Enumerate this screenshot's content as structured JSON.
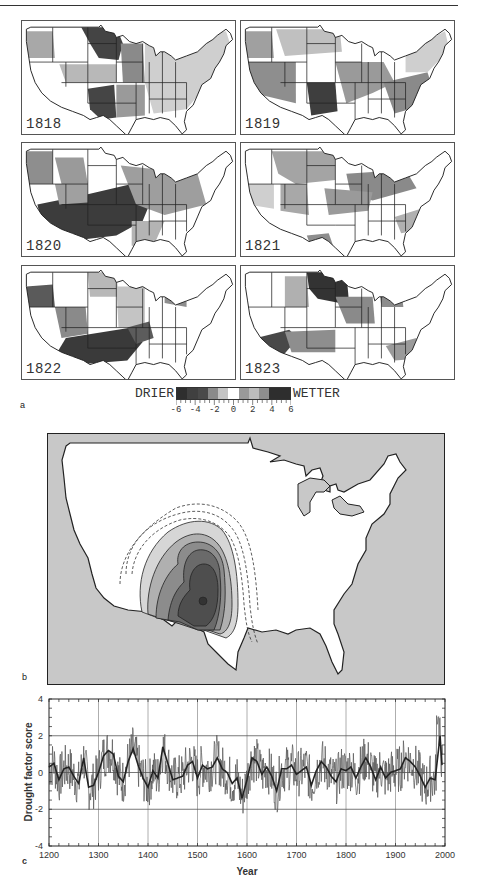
{
  "figure": {
    "panel_a": {
      "letter": "a",
      "maps": [
        {
          "year": "1818"
        },
        {
          "year": "1819"
        },
        {
          "year": "1820"
        },
        {
          "year": "1821"
        },
        {
          "year": "1822"
        },
        {
          "year": "1823"
        }
      ],
      "legend": {
        "left_label": "DRIER",
        "right_label": "WETTER",
        "ticks": [
          "-6",
          "-4",
          "-2",
          "0",
          "2",
          "4",
          "6"
        ],
        "colors": [
          "#2e2e2e",
          "#404040",
          "#4a4a4a",
          "#8a8a8a",
          "#c4c4c4",
          "#ffffff",
          "#9a9a9a",
          "#bcbcbc",
          "#8e8e8e",
          "#2e2e2e",
          "#2e2e2e"
        ]
      }
    },
    "panel_b": {
      "letter": "b",
      "ocean_color": "#c8c8c8",
      "land_color": "#ffffff"
    },
    "panel_c": {
      "letter": "c"
    }
  },
  "chart_data": {
    "type": "line",
    "title": "",
    "xlabel": "Year",
    "ylabel": "Drought factor score",
    "xlim": [
      1200,
      2000
    ],
    "ylim": [
      -4,
      4
    ],
    "xticks": [
      1200,
      1300,
      1400,
      1500,
      1600,
      1700,
      1800,
      1900,
      2000
    ],
    "yticks": [
      -4,
      -2,
      0,
      2,
      4
    ],
    "grid": {
      "vertical": [
        1300,
        1400,
        1500,
        1600,
        1700,
        1800,
        1900
      ],
      "horizontal": [
        -2,
        0,
        2
      ]
    },
    "series": [
      {
        "name": "smoothed",
        "x": [
          1200,
          1210,
          1220,
          1230,
          1240,
          1250,
          1260,
          1270,
          1280,
          1290,
          1300,
          1310,
          1320,
          1330,
          1340,
          1350,
          1360,
          1370,
          1380,
          1390,
          1400,
          1410,
          1420,
          1430,
          1440,
          1450,
          1460,
          1470,
          1480,
          1490,
          1500,
          1510,
          1520,
          1530,
          1540,
          1550,
          1560,
          1570,
          1580,
          1590,
          1600,
          1610,
          1620,
          1630,
          1640,
          1650,
          1660,
          1670,
          1680,
          1690,
          1700,
          1710,
          1720,
          1730,
          1740,
          1750,
          1760,
          1770,
          1780,
          1790,
          1800,
          1810,
          1820,
          1830,
          1840,
          1850,
          1860,
          1870,
          1880,
          1890,
          1900,
          1910,
          1920,
          1930,
          1940,
          1950,
          1960,
          1970,
          1980,
          1990,
          1995
        ],
        "values": [
          0.3,
          0.5,
          -0.4,
          0.2,
          0.3,
          -0.2,
          -0.6,
          0.8,
          -0.8,
          -0.7,
          0.0,
          0.9,
          1.2,
          1.0,
          -0.2,
          -0.5,
          0.6,
          1.3,
          0.4,
          -0.3,
          -0.8,
          0.1,
          -0.3,
          1.4,
          0.5,
          -0.4,
          -0.3,
          -0.2,
          0.4,
          0.6,
          -0.3,
          0.4,
          0.2,
          0.3,
          0.8,
          0.2,
          0.0,
          -0.6,
          -0.3,
          -1.4,
          -0.4,
          0.8,
          0.6,
          -0.1,
          0.3,
          -0.2,
          -1.0,
          0.2,
          0.2,
          0.4,
          -0.1,
          0.1,
          0.3,
          -0.7,
          0.1,
          0.6,
          0.3,
          -0.2,
          -0.5,
          0.2,
          0.1,
          0.3,
          -0.3,
          0.3,
          0.8,
          0.3,
          -0.4,
          0.3,
          -0.3,
          0.0,
          0.1,
          0.2,
          0.8,
          0.6,
          0.3,
          -0.2,
          -0.8,
          -0.3,
          -0.4,
          2.0,
          0.0
        ]
      },
      {
        "name": "annual",
        "note": "high-frequency annual series; range approx -2.5 to 3.2, peak ~3.2 near 1985",
        "values_range": [
          -2.5,
          3.2
        ]
      }
    ]
  }
}
